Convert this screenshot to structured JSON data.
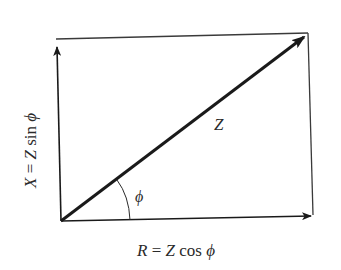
{
  "diagram": {
    "labels": {
      "impedance": "Z",
      "angle": "ϕ",
      "resistance_eq": {
        "var": "R",
        "eq": " = ",
        "mag": "Z",
        "func": " cos ",
        "angle": "ϕ"
      },
      "reactance_eq": {
        "var": "X",
        "eq": " = ",
        "mag": "Z",
        "func": " sin ",
        "angle": "ϕ"
      }
    },
    "colors": {
      "stroke": "#1a1a1a",
      "frame": "#3a3a3a",
      "text": "#2a2a2a",
      "background": "#ffffff"
    }
  }
}
